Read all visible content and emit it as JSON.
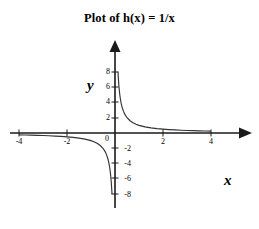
{
  "chart_data": {
    "type": "line",
    "title": "Plot of h(x) = 1/x",
    "function": "h(x) = 1/x",
    "xlabel": "x",
    "ylabel": "y",
    "xlim": [
      -4,
      4
    ],
    "ylim": [
      -8,
      8
    ],
    "grid": false,
    "legend": false,
    "xticks": [
      -4,
      -2,
      0,
      2,
      4
    ],
    "xtick_labels": [
      "-4",
      "-2",
      "0",
      "2",
      "4"
    ],
    "yticks": [
      8,
      6,
      4,
      2,
      0,
      -2,
      -4,
      -6,
      -8
    ],
    "ytick_labels": [
      "8",
      "6",
      "4",
      "2",
      "0",
      "-2",
      "-4",
      "-6",
      "-8"
    ],
    "series": [
      {
        "name": "h(x) = 1/x (x < 0)",
        "color": "#333333",
        "x": [
          -4.0,
          -3.75,
          -3.5,
          -3.25,
          -3.0,
          -2.75,
          -2.5,
          -2.25,
          -2.0,
          -1.75,
          -1.5,
          -1.25,
          -1.0,
          -0.875,
          -0.75,
          -0.625,
          -0.5,
          -0.4,
          -0.35,
          -0.3,
          -0.28,
          -0.26,
          -0.25,
          -0.22,
          -0.2,
          -0.18,
          -0.16,
          -0.14,
          -0.13,
          -0.125
        ],
        "y": [
          -0.25,
          -0.2667,
          -0.2857,
          -0.3077,
          -0.3333,
          -0.3636,
          -0.4,
          -0.4444,
          -0.5,
          -0.5714,
          -0.6667,
          -0.8,
          -1.0,
          -1.1429,
          -1.3333,
          -1.6,
          -2.0,
          -2.5,
          -2.857,
          -3.333,
          -3.571,
          -3.846,
          -4.0,
          -4.545,
          -5.0,
          -5.556,
          -6.25,
          -7.143,
          -7.692,
          -8.0
        ]
      },
      {
        "name": "h(x) = 1/x (x > 0)",
        "color": "#333333",
        "x": [
          0.125,
          0.13,
          0.14,
          0.16,
          0.18,
          0.2,
          0.22,
          0.25,
          0.26,
          0.28,
          0.3,
          0.35,
          0.4,
          0.5,
          0.625,
          0.75,
          0.875,
          1.0,
          1.25,
          1.5,
          1.75,
          2.0,
          2.25,
          2.5,
          2.75,
          3.0,
          3.25,
          3.5,
          3.75,
          4.0
        ],
        "y": [
          8.0,
          7.692,
          7.143,
          6.25,
          5.556,
          5.0,
          4.545,
          4.0,
          3.846,
          3.571,
          3.333,
          2.857,
          2.5,
          2.0,
          1.6,
          1.3333,
          1.1429,
          1.0,
          0.8,
          0.6667,
          0.5714,
          0.5,
          0.4444,
          0.4,
          0.3636,
          0.3333,
          0.3077,
          0.2857,
          0.2667,
          0.25
        ],
        "asymptotes": {
          "vertical": 0,
          "horizontal": 0
        }
      }
    ]
  },
  "axis_labels": {
    "x": "x",
    "y": "y"
  }
}
